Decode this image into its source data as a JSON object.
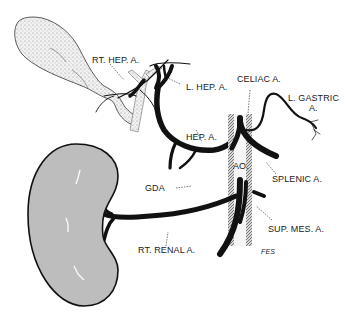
{
  "diagram": {
    "labels": {
      "rt_hep_a": "RT. HEP. A.",
      "l_hep_a": "L. HEP. A.",
      "celiac_a": "CELIAC A.",
      "l_gastric_a_line1": "L. GASTRIC",
      "l_gastric_a_line2": "A.",
      "hep_a": "HEP. A.",
      "ao": "AO.",
      "splenic_a": "SPLENIC A.",
      "gda": "GDA",
      "sup_mes_a": "SUP. MES. A.",
      "rt_renal_a": "RT. RENAL A.",
      "signature": "FES"
    },
    "structures": [
      "gallbladder",
      "bile-duct",
      "right-hepatic-artery",
      "left-hepatic-artery",
      "celiac-artery",
      "left-gastric-artery",
      "hepatic-artery",
      "aorta",
      "splenic-artery",
      "gastroduodenal-artery",
      "superior-mesenteric-artery",
      "right-renal-artery",
      "right-kidney"
    ],
    "colors": {
      "ink": "#111111",
      "kidney_fill": "#bdbdbd",
      "stipple": "#9a9a9a",
      "background": "#ffffff"
    }
  }
}
